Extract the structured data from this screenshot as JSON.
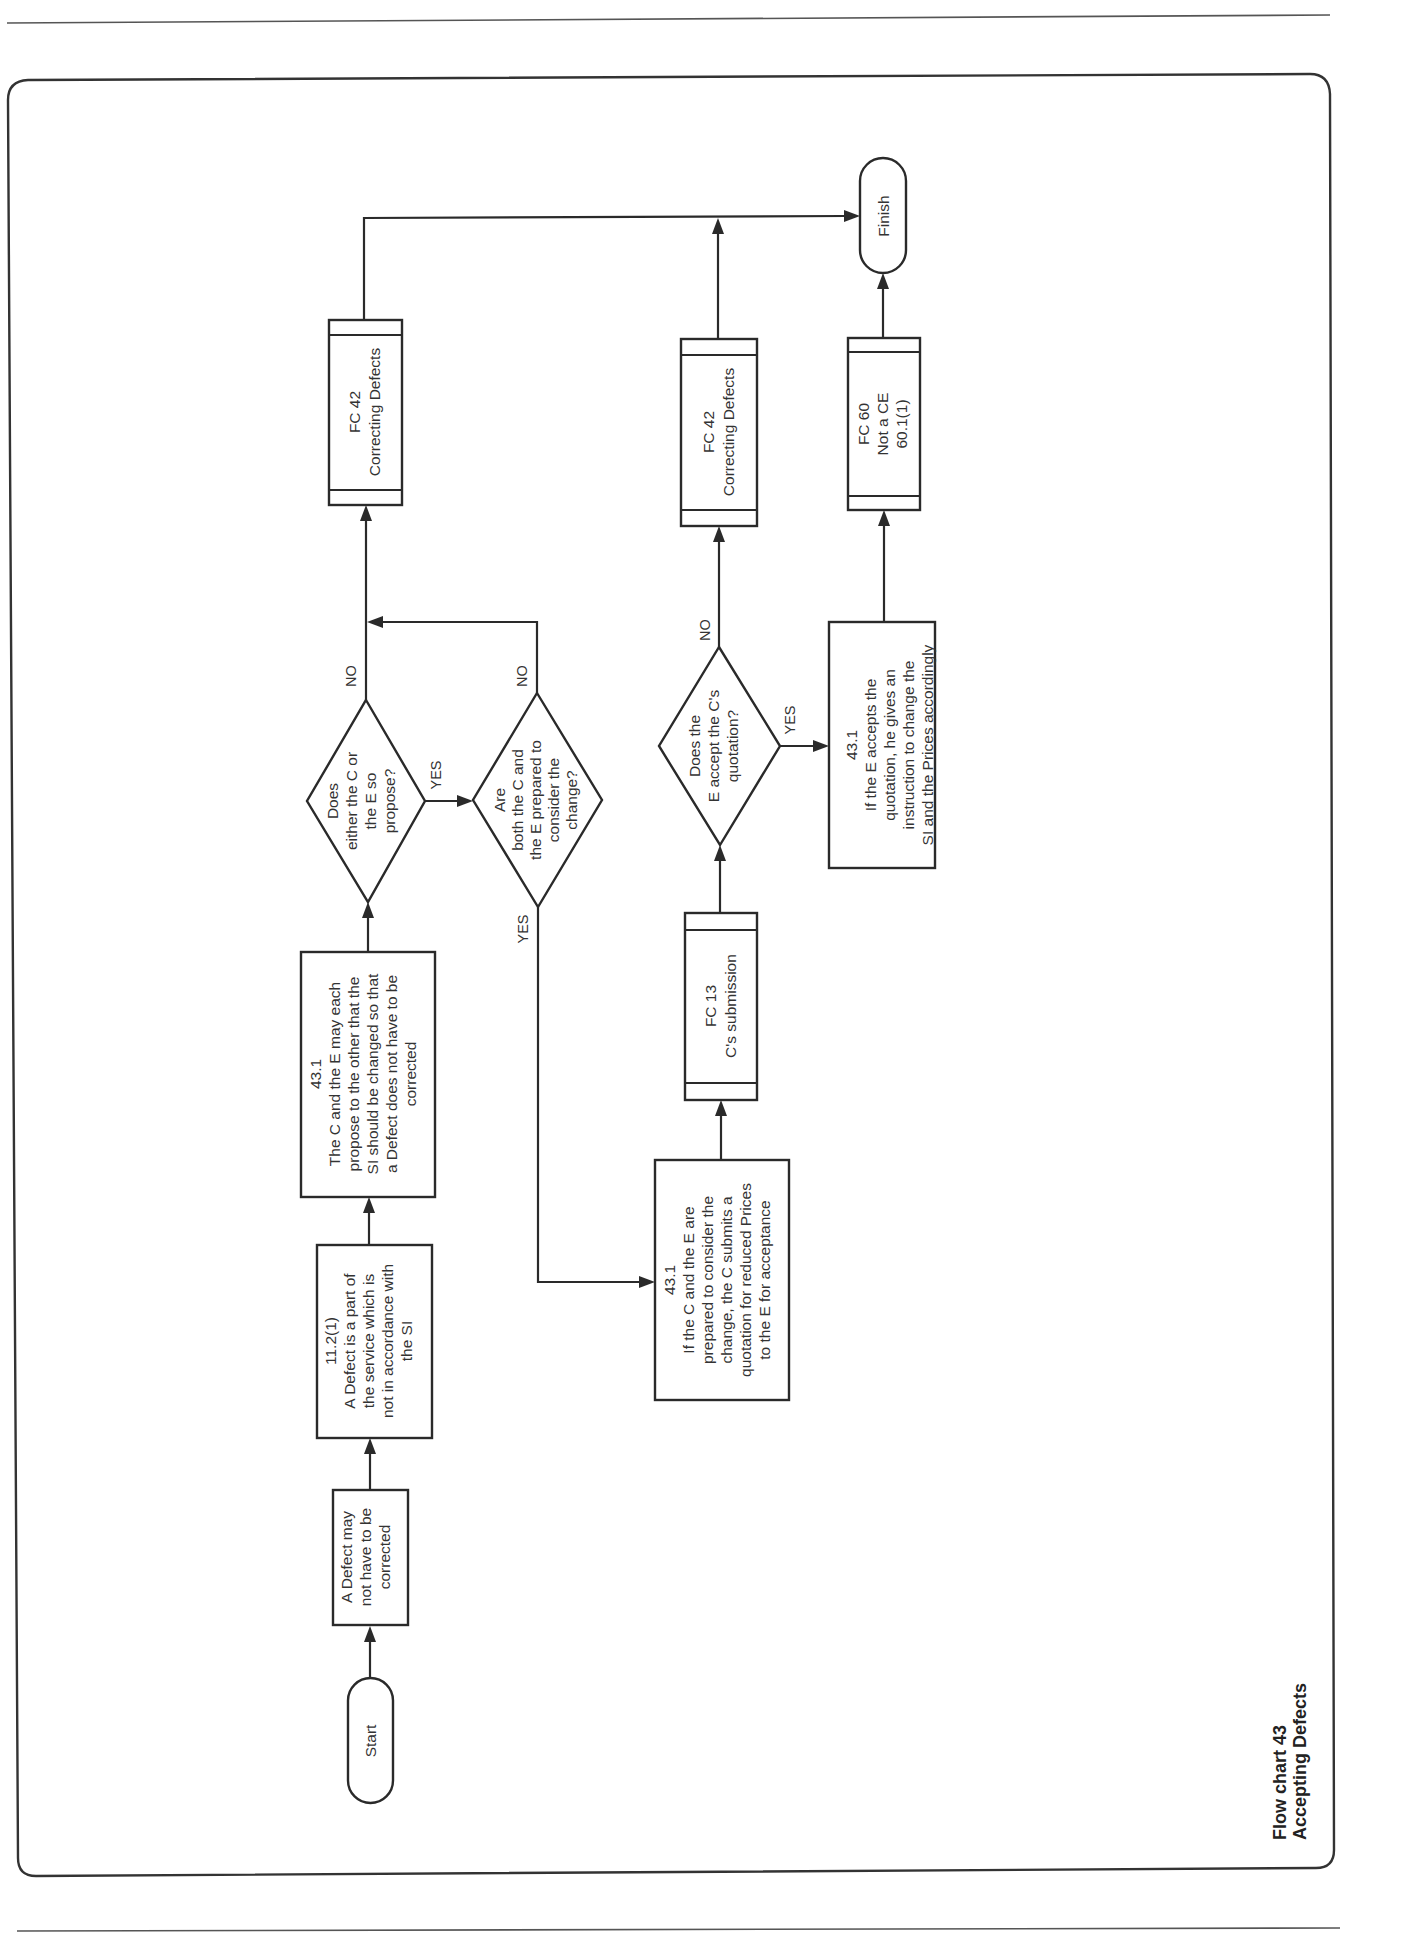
{
  "title": {
    "line1": "Flow chart 43",
    "line2": "Accepting Defects"
  },
  "nodes": {
    "start": {
      "label": "Start"
    },
    "finish": {
      "label": "Finish"
    },
    "defect_may": {
      "lines": [
        "A Defect may",
        "not have to be",
        "corrected"
      ]
    },
    "clause_11_2_1": {
      "lines": [
        "11.2(1)",
        "A Defect is a part of",
        "the service which is",
        "not in accordance with",
        "the SI"
      ]
    },
    "clause_43_1_propose": {
      "lines": [
        "43.1",
        "The C and the E may each",
        "propose to the other that the",
        "SI should be changed so that",
        "a Defect does not have to be",
        "corrected"
      ]
    },
    "decision_propose": {
      "lines": [
        "Does",
        "either the C or",
        "the E so",
        "propose?"
      ]
    },
    "decision_prepared": {
      "lines": [
        "Are",
        "both the C and",
        "the E prepared to",
        "consider the",
        "change?"
      ]
    },
    "fc42_a": {
      "lines": [
        "FC 42",
        "Correcting Defects"
      ]
    },
    "clause_43_1_quote": {
      "lines": [
        "43.1",
        "If the C and the E are",
        "prepared to consider the",
        "change, the C submits a",
        "quotation for reduced Prices",
        "to the E for acceptance"
      ]
    },
    "fc13": {
      "lines": [
        "FC 13",
        "C's submission"
      ]
    },
    "decision_accept": {
      "lines": [
        "Does the",
        "E accept the C's",
        "quotation?"
      ]
    },
    "fc42_b": {
      "lines": [
        "FC 42",
        "Correcting Defects"
      ]
    },
    "clause_43_1_accept": {
      "lines": [
        "43.1",
        "If the E accepts the",
        "quotation, he gives an",
        "instruction to change the",
        "SI and the Prices accordingly"
      ]
    },
    "fc60": {
      "lines": [
        "FC 60",
        "Not a CE",
        "60.1(1)"
      ]
    }
  },
  "edge_labels": {
    "d1_yes": "YES",
    "d1_no": "NO",
    "d2_yes": "YES",
    "d2_no": "NO",
    "d3_yes": "YES",
    "d3_no": "NO"
  }
}
